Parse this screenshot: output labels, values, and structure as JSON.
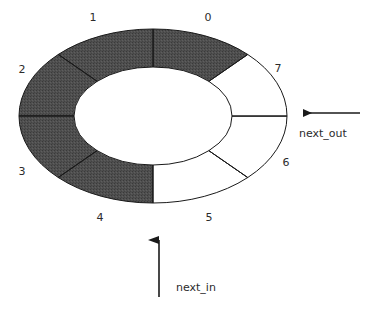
{
  "diagram": {
    "kind": "circular-buffer-ring",
    "colors": {
      "filled": "#4a4a4a",
      "empty": "#ffffff",
      "outline": "#1a1a1a",
      "text": "#2b2b2b",
      "background": "#ffffff"
    },
    "ring": {
      "center_x": 153,
      "center_y": 116,
      "outer_rx": 134,
      "outer_ry": 87,
      "inner_rx": 79,
      "inner_ry": 49,
      "slot_count": 8
    },
    "slots": [
      {
        "id": "slot-0",
        "label": "0",
        "state": "filled",
        "label_x": 208,
        "label_y": 18
      },
      {
        "id": "slot-1",
        "label": "1",
        "state": "filled",
        "label_x": 93,
        "label_y": 18
      },
      {
        "id": "slot-2",
        "label": "2",
        "state": "filled",
        "label_x": 22,
        "label_y": 70
      },
      {
        "id": "slot-3",
        "label": "3",
        "state": "filled",
        "label_x": 22,
        "label_y": 172
      },
      {
        "id": "slot-4",
        "label": "4",
        "state": "filled",
        "label_x": 100,
        "label_y": 218
      },
      {
        "id": "slot-5",
        "label": "5",
        "state": "empty",
        "label_x": 209,
        "label_y": 218
      },
      {
        "id": "slot-6",
        "label": "6",
        "state": "empty",
        "label_x": 286,
        "label_y": 163
      },
      {
        "id": "slot-7",
        "label": "7",
        "state": "empty",
        "label_x": 278,
        "label_y": 69
      }
    ],
    "pointers": [
      {
        "id": "next-out",
        "label": "next_out",
        "direction": "left",
        "label_x": 299,
        "label_y": 134,
        "arrow_tip_x": 293,
        "arrow_tail_x": 360,
        "arrow_y": 113
      },
      {
        "id": "next-in",
        "label": "next_in",
        "direction": "up",
        "label_x": 176,
        "label_y": 288,
        "arrow_tip_y": 228,
        "arrow_tail_y": 297,
        "arrow_x": 159
      }
    ]
  }
}
